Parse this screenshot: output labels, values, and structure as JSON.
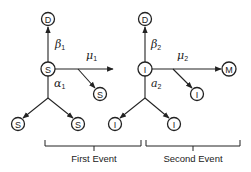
{
  "diagram": {
    "nodes": {
      "d1": "D",
      "s_main": "S",
      "s_branch": "S",
      "s_left": "S",
      "s_right": "S",
      "d2": "D",
      "i_main": "I",
      "i_branch": "I",
      "i_left": "I",
      "i_right": "I",
      "m": "M"
    },
    "rates": {
      "beta1": {
        "symbol": "β",
        "sub": "1"
      },
      "mu1": {
        "symbol": "μ",
        "sub": "1"
      },
      "alpha1": {
        "symbol": "α",
        "sub": "1"
      },
      "beta2": {
        "symbol": "β",
        "sub": "2"
      },
      "mu2": {
        "symbol": "μ",
        "sub": "2"
      },
      "alpha2": {
        "symbol": "a",
        "sub": "2"
      }
    },
    "events": {
      "first": "First Event",
      "second": "Second Event"
    }
  }
}
